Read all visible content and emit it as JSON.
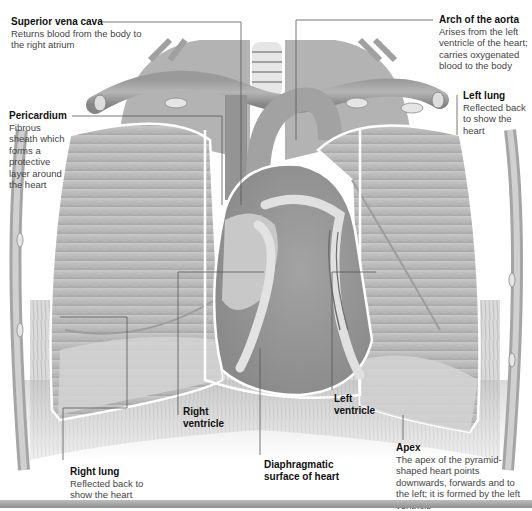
{
  "figure": {
    "colors": {
      "background": "#ffffff",
      "tissue_light": "#d6d6d6",
      "tissue_mid": "#a8a8a8",
      "tissue_dark": "#7a7a7a",
      "outline": "#ffffff",
      "leader_line": "#555555",
      "label_title": "#111111",
      "label_text": "#444444"
    }
  },
  "labels": {
    "superior_vena_cava": {
      "title": "Superior vena cava",
      "desc": "Returns blood from the body to the right atrium"
    },
    "arch_of_aorta": {
      "title": "Arch of the aorta",
      "desc": "Arises from the left ventricle of the heart; carries oxygenated blood to the body"
    },
    "pericardium": {
      "title": "Pericardium",
      "desc": "Fibrous sheath which forms a protective layer around the heart"
    },
    "left_lung": {
      "title": "Left lung",
      "desc": "Reflected back to show the heart"
    },
    "right_ventricle": {
      "title": "Right ventricle"
    },
    "left_ventricle": {
      "title": "Left ventricle"
    },
    "diaphragmatic_surface": {
      "title": "Diaphragmatic surface of heart"
    },
    "apex": {
      "title": "Apex",
      "desc": "The apex of the pyramid-shaped heart points downwards, forwards and to the left; it is formed by the left ventricle"
    },
    "right_lung": {
      "title": "Right lung",
      "desc": "Reflected back to show the heart"
    }
  }
}
